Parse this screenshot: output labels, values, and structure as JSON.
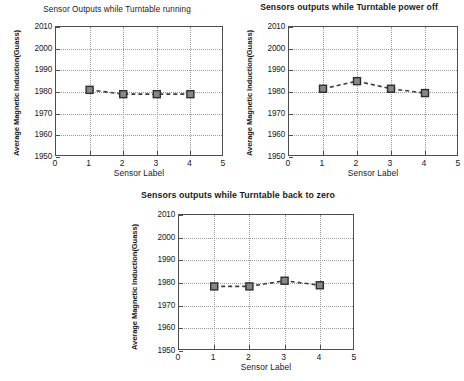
{
  "chart_data": [
    {
      "type": "line",
      "title": "Sensor Outputs while Turntable running",
      "xlabel": "Sensor Label",
      "ylabel": "Average Magnetic Induction(Guass)",
      "x": [
        1,
        2,
        3,
        4
      ],
      "values": [
        1981,
        1979,
        1979,
        1979
      ],
      "categories": [
        "1",
        "2",
        "3",
        "4"
      ],
      "xlim": [
        0,
        5
      ],
      "ylim": [
        1950,
        2010
      ],
      "xticks": [
        "0",
        "1",
        "2",
        "3",
        "4",
        "5"
      ],
      "yticks": [
        "1950",
        "1960",
        "1970",
        "1980",
        "1990",
        "2000",
        "2010"
      ],
      "grid": true,
      "legend": null,
      "marker": "square",
      "linestyle": "dashed",
      "color": "#878787"
    },
    {
      "type": "line",
      "title": "Sensors outputs while Turntable power off",
      "xlabel": "Sensor Label",
      "ylabel": "Average Magnetic Induction(Guass)",
      "x": [
        1,
        2,
        3,
        4
      ],
      "values": [
        1981.5,
        1985,
        1981.5,
        1979.5
      ],
      "categories": [
        "1",
        "2",
        "3",
        "4"
      ],
      "xlim": [
        0,
        5
      ],
      "ylim": [
        1950,
        2010
      ],
      "xticks": [
        "0",
        "1",
        "2",
        "3",
        "4",
        "5"
      ],
      "yticks": [
        "1950",
        "1960",
        "1970",
        "1980",
        "1990",
        "2000",
        "2010"
      ],
      "grid": true,
      "legend": null,
      "marker": "square",
      "linestyle": "dashed",
      "color": "#878787"
    },
    {
      "type": "line",
      "title": "Sensors outputs while Turntable back to zero",
      "xlabel": "Sensor Label",
      "ylabel": "Average Magnetic Induction(Guass)",
      "x": [
        1,
        2,
        3,
        4
      ],
      "values": [
        1978.5,
        1978.5,
        1981,
        1979
      ],
      "categories": [
        "1",
        "2",
        "3",
        "4"
      ],
      "xlim": [
        0,
        5
      ],
      "ylim": [
        1950,
        2010
      ],
      "xticks": [
        "0",
        "1",
        "2",
        "3",
        "4",
        "5"
      ],
      "yticks": [
        "1950",
        "1960",
        "1970",
        "1980",
        "1990",
        "2000",
        "2010"
      ],
      "grid": true,
      "legend": null,
      "marker": "square",
      "linestyle": "dashed",
      "color": "#878787"
    }
  ],
  "figures": [
    {
      "id": "fig-1",
      "title": "Sensor Outputs while Turntable running",
      "xlabel": "Sensor Label",
      "ylabel": "Average Magnetic Induction(Guass)"
    },
    {
      "id": "fig-2",
      "title": "Sensors outputs while Turntable power off",
      "xlabel": "Sensor Label",
      "ylabel": "Average Magnetic Induction(Guass)"
    },
    {
      "id": "fig-3",
      "title": "Sensors outputs while Turntable back to zero",
      "xlabel": "Sensor Label",
      "ylabel": "Average Magnetic Induction(Guass)"
    }
  ]
}
